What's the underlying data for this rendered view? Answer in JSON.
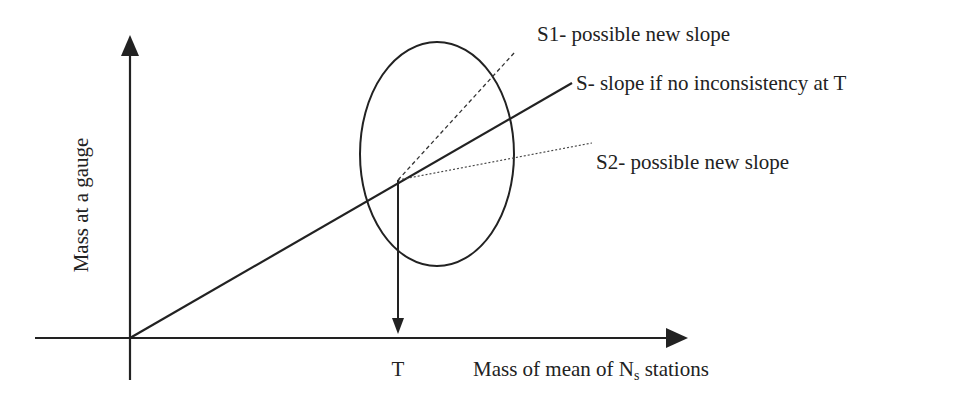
{
  "diagram": {
    "type": "double-mass-curve schematic",
    "axes": {
      "y_label": "Mass at a gauge",
      "x_label_prefix": "Mass of mean of N",
      "x_label_subscript": "s",
      "x_label_suffix": " stations",
      "x_tick_label": "T"
    },
    "lines": [
      {
        "id": "S",
        "style": "solid",
        "label": "S- slope if no inconsistency at T"
      },
      {
        "id": "S1",
        "style": "dashed",
        "label": "S1- possible new slope"
      },
      {
        "id": "S2",
        "style": "dotted",
        "label": "S2- possible new slope"
      }
    ],
    "annotations": {
      "ellipse": "region of inconsistency around T",
      "drop_arrow": "from break point down to T on x-axis"
    },
    "colors": {
      "ink": "#222222",
      "background": "#ffffff"
    }
  }
}
